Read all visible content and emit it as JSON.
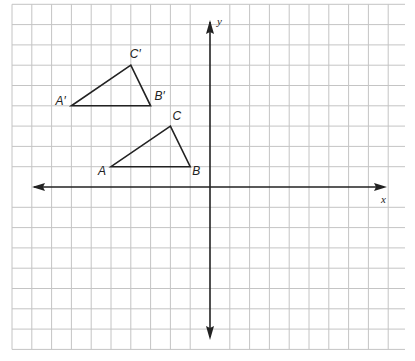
{
  "diagram": {
    "type": "coordinate-plane",
    "axes": {
      "x_label": "x",
      "y_label": "y",
      "x_range": [
        -10,
        9
      ],
      "y_range": [
        -8,
        9
      ],
      "grid_step": 1
    },
    "figures": [
      {
        "name": "triangle-ABC",
        "vertices": [
          {
            "label": "A",
            "x": -5,
            "y": 1
          },
          {
            "label": "B",
            "x": -1,
            "y": 1
          },
          {
            "label": "C",
            "x": -2,
            "y": 3
          }
        ]
      },
      {
        "name": "triangle-A-prime-B-prime-C-prime",
        "vertices": [
          {
            "label": "A′",
            "x": -7,
            "y": 4
          },
          {
            "label": "B′",
            "x": -3,
            "y": 4
          },
          {
            "label": "C′",
            "x": -4,
            "y": 6
          }
        ]
      }
    ],
    "colors": {
      "grid": "#c4c4c4",
      "ink": "#222222",
      "background": "#ffffff"
    }
  }
}
